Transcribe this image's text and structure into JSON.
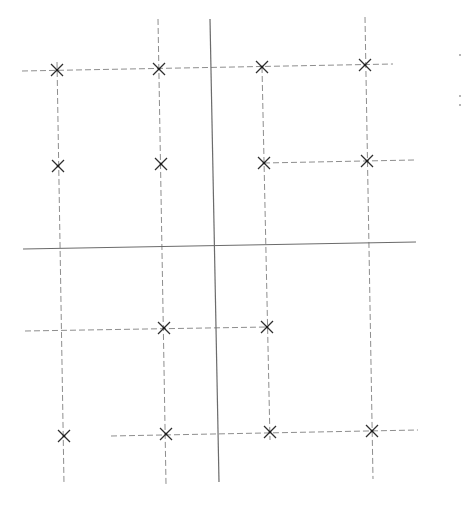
{
  "diagram": {
    "title": "",
    "colors": {
      "background": "#ffffff",
      "solid_line": "#6b6b6b",
      "dashed_line": "#8e8e8e",
      "marker": "#2f2f2f"
    },
    "marker_icon": "x-cross",
    "columns": [
      {
        "id": "col-1",
        "markers": [
          "r1",
          "r2",
          "r4"
        ]
      },
      {
        "id": "col-2",
        "markers": [
          "r1",
          "r2",
          "r3",
          "r4"
        ]
      },
      {
        "id": "col-3",
        "markers": [
          "r1",
          "r2",
          "r3",
          "r4"
        ]
      },
      {
        "id": "col-4",
        "markers": [
          "r1",
          "r2",
          "r4"
        ]
      }
    ],
    "rows": [
      {
        "id": "r1",
        "label": "top row"
      },
      {
        "id": "r2",
        "label": "second row"
      },
      {
        "id": "r3",
        "label": "third row"
      },
      {
        "id": "r4",
        "label": "bottom row"
      }
    ],
    "marker_count": 14,
    "solid_dividers": [
      "vertical",
      "horizontal"
    ]
  }
}
